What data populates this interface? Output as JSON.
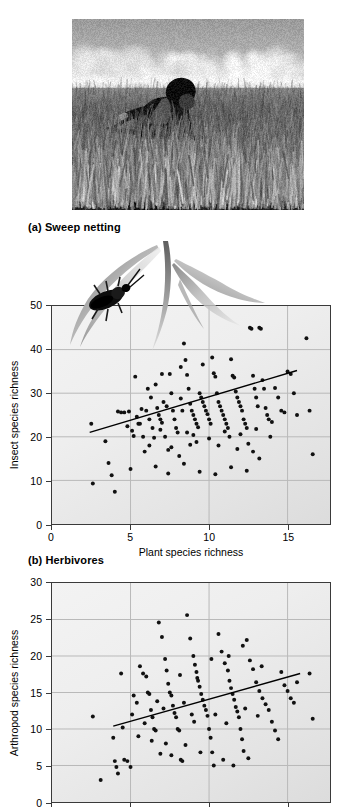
{
  "figure": {
    "panels": [
      {
        "caption": "(a) Sweep netting"
      },
      {
        "caption": "(b) Herbivores"
      }
    ],
    "photo": {
      "alt_name": "sweep-netting-photograph",
      "description": "Researcher sweeping an insect net through tall grassland under a cloudy sky",
      "style": "black-and-white"
    },
    "illustration": {
      "alt_name": "grass-and-beetle-illustration",
      "description": "Grayscale drawing of grass blades with a beetle perched on a leaf"
    }
  },
  "colors": {
    "point": "#111111",
    "regression_line": "#000000",
    "axis": "#3a3a3a",
    "grid": "#b9b9b9",
    "plot_bg_light": "#f3f3f3",
    "plot_bg_dark": "#dcdcdc",
    "text": "#000000"
  },
  "chart_data": [
    {
      "type": "scatter",
      "id": "insect-species-richness",
      "title": "(b) Herbivores",
      "xlabel": "Plant species richness",
      "ylabel": "Insect species richness",
      "xlim": [
        0,
        17.7
      ],
      "ylim": [
        0,
        50
      ],
      "xticks": [
        0,
        5,
        10,
        15
      ],
      "yticks": [
        0,
        10,
        20,
        30,
        40,
        50
      ],
      "grid": true,
      "legend": "none",
      "regression": {
        "x1": 2.4,
        "y1": 21.0,
        "x2": 15.6,
        "y2": 35.2
      },
      "points": [
        [
          2.5,
          23.0
        ],
        [
          2.6,
          9.3
        ],
        [
          3.4,
          19.0
        ],
        [
          3.6,
          14.0
        ],
        [
          3.8,
          11.2
        ],
        [
          4.0,
          7.4
        ],
        [
          4.2,
          25.8
        ],
        [
          4.4,
          25.6
        ],
        [
          4.6,
          25.6
        ],
        [
          4.9,
          25.8
        ],
        [
          5.1,
          21.4
        ],
        [
          5.2,
          20.2
        ],
        [
          5.3,
          33.8
        ],
        [
          5.4,
          24.6
        ],
        [
          5.5,
          23.0
        ],
        [
          5.6,
          23.0
        ],
        [
          5.8,
          20.0
        ],
        [
          5.9,
          16.6
        ],
        [
          6.0,
          26.0
        ],
        [
          6.1,
          31.0
        ],
        [
          6.2,
          24.0
        ],
        [
          6.3,
          29.0
        ],
        [
          6.4,
          22.0
        ],
        [
          6.5,
          19.8
        ],
        [
          6.6,
          32.0
        ],
        [
          6.7,
          26.6
        ],
        [
          6.8,
          25.0
        ],
        [
          6.9,
          24.0
        ],
        [
          7.0,
          23.2
        ],
        [
          7.1,
          28.0
        ],
        [
          7.2,
          20.0
        ],
        [
          7.3,
          27.0
        ],
        [
          7.4,
          17.0
        ],
        [
          7.5,
          34.4
        ],
        [
          7.6,
          30.0
        ],
        [
          7.7,
          26.0
        ],
        [
          7.8,
          24.0
        ],
        [
          7.9,
          22.0
        ],
        [
          8.0,
          21.0
        ],
        [
          8.1,
          15.6
        ],
        [
          8.2,
          28.8
        ],
        [
          8.3,
          26.0
        ],
        [
          8.4,
          41.4
        ],
        [
          8.5,
          37.6
        ],
        [
          8.6,
          34.2
        ],
        [
          8.7,
          31.0
        ],
        [
          8.8,
          27.6
        ],
        [
          8.9,
          26.0
        ],
        [
          9.0,
          25.0
        ],
        [
          9.1,
          24.0
        ],
        [
          9.2,
          23.0
        ],
        [
          9.3,
          22.2
        ],
        [
          9.4,
          30.0
        ],
        [
          9.5,
          29.0
        ],
        [
          9.6,
          28.0
        ],
        [
          9.7,
          27.0
        ],
        [
          9.8,
          26.0
        ],
        [
          9.9,
          25.2
        ],
        [
          10.0,
          24.0
        ],
        [
          10.1,
          23.0
        ],
        [
          10.2,
          38.2
        ],
        [
          10.3,
          34.6
        ],
        [
          10.4,
          33.8
        ],
        [
          10.5,
          30.0
        ],
        [
          10.6,
          28.0
        ],
        [
          10.7,
          27.0
        ],
        [
          10.8,
          26.0
        ],
        [
          10.9,
          25.0
        ],
        [
          11.0,
          24.0
        ],
        [
          11.1,
          23.0
        ],
        [
          11.2,
          22.0
        ],
        [
          11.3,
          20.0
        ],
        [
          11.4,
          37.8
        ],
        [
          11.5,
          34.0
        ],
        [
          11.6,
          33.6
        ],
        [
          11.7,
          30.4
        ],
        [
          11.8,
          29.0
        ],
        [
          11.9,
          28.0
        ],
        [
          12.0,
          27.0
        ],
        [
          12.1,
          26.0
        ],
        [
          12.2,
          24.0
        ],
        [
          12.3,
          23.0
        ],
        [
          12.4,
          22.0
        ],
        [
          12.5,
          18.4
        ],
        [
          12.6,
          45.0
        ],
        [
          12.7,
          44.8
        ],
        [
          12.8,
          34.0
        ],
        [
          12.9,
          31.0
        ],
        [
          13.0,
          29.0
        ],
        [
          13.1,
          27.0
        ],
        [
          13.2,
          45.0
        ],
        [
          13.3,
          44.8
        ],
        [
          13.4,
          33.0
        ],
        [
          13.5,
          31.0
        ],
        [
          13.6,
          26.6
        ],
        [
          13.7,
          25.0
        ],
        [
          13.8,
          24.0
        ],
        [
          13.9,
          20.0
        ],
        [
          14.2,
          31.2
        ],
        [
          14.4,
          29.0
        ],
        [
          14.6,
          26.0
        ],
        [
          14.8,
          25.6
        ],
        [
          15.0,
          35.0
        ],
        [
          15.2,
          34.4
        ],
        [
          15.4,
          30.0
        ],
        [
          15.6,
          25.0
        ],
        [
          16.2,
          42.6
        ],
        [
          16.4,
          26.0
        ],
        [
          16.6,
          16.0
        ],
        [
          5.0,
          12.6
        ],
        [
          6.6,
          13.2
        ],
        [
          7.4,
          11.6
        ],
        [
          8.4,
          13.8
        ],
        [
          9.4,
          12.0
        ],
        [
          10.4,
          11.4
        ],
        [
          11.4,
          13.0
        ],
        [
          12.4,
          12.2
        ],
        [
          7.0,
          34.4
        ],
        [
          8.2,
          36.0
        ],
        [
          9.6,
          36.6
        ],
        [
          6.2,
          18.0
        ],
        [
          7.6,
          17.6
        ],
        [
          8.8,
          18.2
        ],
        [
          9.2,
          18.8
        ],
        [
          10.6,
          18.0
        ],
        [
          11.8,
          17.2
        ],
        [
          12.8,
          16.6
        ],
        [
          13.2,
          15.0
        ],
        [
          4.8,
          22.4
        ],
        [
          5.7,
          26.4
        ],
        [
          6.9,
          21.6
        ],
        [
          8.6,
          21.0
        ],
        [
          9.0,
          20.4
        ],
        [
          10.0,
          19.6
        ],
        [
          11.0,
          21.2
        ],
        [
          12.0,
          20.6
        ],
        [
          13.0,
          21.8
        ],
        [
          14.0,
          23.4
        ]
      ]
    },
    {
      "type": "scatter",
      "id": "arthropod-species-richness",
      "xlabel": "Plant species richness",
      "ylabel": "Arthropod species richness",
      "xlim": [
        0,
        17.7
      ],
      "ylim": [
        0,
        30
      ],
      "xticks": [
        0,
        5,
        10,
        15
      ],
      "yticks": [
        0,
        5,
        10,
        15,
        20,
        25,
        30
      ],
      "grid": true,
      "legend": "none",
      "note": "Plot is cropped by the bottom edge of the screenshot",
      "regression": {
        "x1": 3.9,
        "y1": 10.4,
        "x2": 15.8,
        "y2": 17.6
      },
      "points": [
        [
          2.6,
          11.7
        ],
        [
          3.1,
          3.0
        ],
        [
          3.9,
          8.8
        ],
        [
          4.0,
          5.6
        ],
        [
          4.1,
          4.8
        ],
        [
          4.2,
          3.9
        ],
        [
          4.4,
          17.6
        ],
        [
          4.6,
          5.8
        ],
        [
          4.8,
          5.6
        ],
        [
          5.0,
          4.8
        ],
        [
          5.2,
          14.6
        ],
        [
          5.4,
          13.6
        ],
        [
          5.6,
          18.6
        ],
        [
          5.8,
          17.6
        ],
        [
          6.0,
          17.2
        ],
        [
          6.1,
          15.0
        ],
        [
          6.2,
          14.8
        ],
        [
          6.3,
          12.6
        ],
        [
          6.4,
          11.6
        ],
        [
          6.5,
          10.0
        ],
        [
          6.6,
          9.8
        ],
        [
          6.8,
          24.6
        ],
        [
          7.0,
          22.6
        ],
        [
          7.2,
          19.6
        ],
        [
          7.3,
          18.0
        ],
        [
          7.4,
          16.2
        ],
        [
          7.5,
          15.0
        ],
        [
          7.6,
          14.6
        ],
        [
          7.7,
          13.2
        ],
        [
          7.8,
          12.2
        ],
        [
          7.9,
          11.6
        ],
        [
          8.0,
          10.0
        ],
        [
          8.1,
          9.8
        ],
        [
          8.2,
          5.8
        ],
        [
          8.3,
          5.6
        ],
        [
          8.6,
          25.6
        ],
        [
          8.8,
          22.4
        ],
        [
          9.0,
          20.0
        ],
        [
          9.1,
          18.8
        ],
        [
          9.2,
          17.8
        ],
        [
          9.3,
          16.6
        ],
        [
          9.4,
          15.8
        ],
        [
          9.5,
          14.8
        ],
        [
          9.6,
          14.0
        ],
        [
          9.7,
          13.2
        ],
        [
          9.8,
          12.6
        ],
        [
          9.9,
          11.8
        ],
        [
          10.0,
          10.0
        ],
        [
          10.1,
          8.8
        ],
        [
          10.2,
          6.8
        ],
        [
          10.3,
          5.0
        ],
        [
          10.6,
          23.0
        ],
        [
          10.8,
          20.6
        ],
        [
          11.0,
          19.0
        ],
        [
          11.2,
          18.0
        ],
        [
          11.3,
          16.6
        ],
        [
          11.4,
          15.6
        ],
        [
          11.5,
          14.8
        ],
        [
          11.6,
          14.0
        ],
        [
          11.7,
          13.0
        ],
        [
          11.8,
          12.4
        ],
        [
          11.9,
          11.6
        ],
        [
          12.0,
          10.0
        ],
        [
          12.1,
          8.6
        ],
        [
          12.2,
          7.0
        ],
        [
          12.4,
          22.2
        ],
        [
          12.6,
          19.4
        ],
        [
          12.8,
          18.2
        ],
        [
          13.0,
          16.4
        ],
        [
          13.2,
          15.2
        ],
        [
          13.4,
          14.2
        ],
        [
          13.6,
          13.4
        ],
        [
          13.8,
          12.6
        ],
        [
          14.0,
          11.0
        ],
        [
          14.2,
          9.8
        ],
        [
          14.4,
          8.6
        ],
        [
          14.6,
          17.8
        ],
        [
          14.8,
          16.0
        ],
        [
          15.0,
          15.2
        ],
        [
          15.2,
          14.2
        ],
        [
          15.4,
          13.6
        ],
        [
          15.6,
          16.4
        ],
        [
          16.4,
          17.6
        ],
        [
          16.6,
          11.4
        ],
        [
          5.1,
          12.0
        ],
        [
          5.9,
          10.8
        ],
        [
          6.7,
          13.8
        ],
        [
          7.1,
          12.8
        ],
        [
          8.4,
          13.6
        ],
        [
          8.9,
          12.0
        ],
        [
          9.05,
          11.0
        ],
        [
          10.4,
          12.0
        ],
        [
          11.1,
          10.8
        ],
        [
          12.3,
          12.8
        ],
        [
          13.1,
          11.8
        ],
        [
          6.9,
          6.6
        ],
        [
          7.6,
          6.4
        ],
        [
          8.5,
          7.8
        ],
        [
          9.45,
          6.8
        ],
        [
          10.9,
          5.8
        ],
        [
          11.55,
          5.0
        ],
        [
          12.5,
          6.0
        ],
        [
          4.5,
          10.2
        ],
        [
          5.5,
          9.0
        ],
        [
          6.35,
          8.4
        ],
        [
          7.25,
          8.0
        ],
        [
          8.15,
          17.4
        ],
        [
          9.25,
          17.0
        ],
        [
          10.15,
          19.6
        ],
        [
          11.25,
          20.0
        ],
        [
          12.15,
          21.4
        ],
        [
          13.35,
          18.6
        ]
      ]
    }
  ]
}
